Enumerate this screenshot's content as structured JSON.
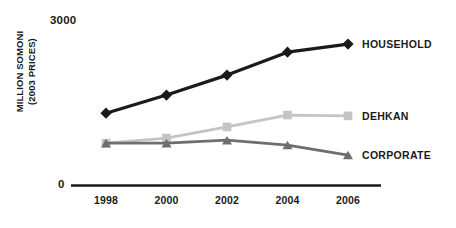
{
  "chart_data": {
    "type": "line",
    "title": "",
    "xlabel": "",
    "ylabel": "MILLION SOMONI (2003 PRICES)",
    "ylabel_line1": "MILLION SOMONI",
    "ylabel_line2": "(2003 PRICES)",
    "categories": [
      "1998",
      "2000",
      "2002",
      "2004",
      "2006"
    ],
    "x": [
      1998,
      2000,
      2002,
      2004,
      2006
    ],
    "ylim": [
      0,
      3000
    ],
    "y_tick_labels": [
      "0",
      "3000"
    ],
    "y_axis_min_label": "0",
    "y_axis_max_label": "3000",
    "grid": false,
    "legend_position": "right-inline-end-of-line",
    "series": [
      {
        "name": "HOUSEHOLD",
        "label": "HOUSEHOLD",
        "color": "#1a1a1a",
        "marker": "diamond",
        "values": [
          1330,
          1665,
          2035,
          2460,
          2610
        ]
      },
      {
        "name": "DEHKAN",
        "label": "DEHKAN",
        "color": "#c4c4c4",
        "marker": "square",
        "values": [
          775,
          870,
          1075,
          1295,
          1280
        ]
      },
      {
        "name": "CORPORATE",
        "label": "CORPORATE",
        "color": "#6e6e6e",
        "marker": "triangle",
        "values": [
          775,
          775,
          830,
          740,
          555
        ]
      }
    ]
  },
  "axis": {
    "baseline_color": "#1a1a1a"
  }
}
